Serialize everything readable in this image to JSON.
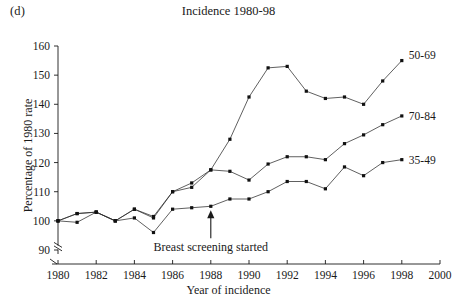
{
  "panel": {
    "label": "(d)"
  },
  "chart_data": {
    "type": "line",
    "title": "Incidence 1980-98",
    "xlabel": "Year of incidence",
    "ylabel": "Percentage of 1980 rate",
    "xlim": [
      1980,
      2000
    ],
    "ylim": [
      90,
      160
    ],
    "xticks": [
      1980,
      1982,
      1984,
      1986,
      1988,
      1990,
      1992,
      1994,
      1996,
      1998,
      2000
    ],
    "yticks": [
      90,
      100,
      110,
      120,
      130,
      140,
      150,
      160
    ],
    "y_axis_break": true,
    "grid": false,
    "legend_position": "right-inline",
    "x": [
      1980,
      1981,
      1982,
      1983,
      1984,
      1985,
      1986,
      1987,
      1988,
      1989,
      1990,
      1991,
      1992,
      1993,
      1994,
      1995,
      1996,
      1997,
      1998
    ],
    "series": [
      {
        "name": "50-69",
        "label": "50-69",
        "values": [
          100,
          102.5,
          103,
          100,
          104,
          101,
          110,
          111.5,
          117.5,
          128,
          142.5,
          152.5,
          153,
          144.5,
          142,
          142.5,
          140,
          148,
          155
        ]
      },
      {
        "name": "70-84",
        "label": "70-84",
        "values": [
          100,
          102.5,
          103,
          100,
          104,
          101.5,
          110,
          113,
          117.5,
          117,
          114,
          119.5,
          122,
          122,
          121,
          126.5,
          129.5,
          133,
          136
        ]
      },
      {
        "name": "35-49",
        "label": "35-49",
        "values": [
          100,
          99.5,
          103,
          100,
          101,
          96,
          104,
          104.5,
          105,
          107.5,
          107.5,
          110,
          113.5,
          113.5,
          111,
          118.5,
          115.5,
          120,
          121
        ]
      }
    ],
    "annotations": [
      {
        "text": "Breast screening started",
        "x": 1988,
        "y": 105,
        "style": "arrow-up"
      }
    ]
  }
}
